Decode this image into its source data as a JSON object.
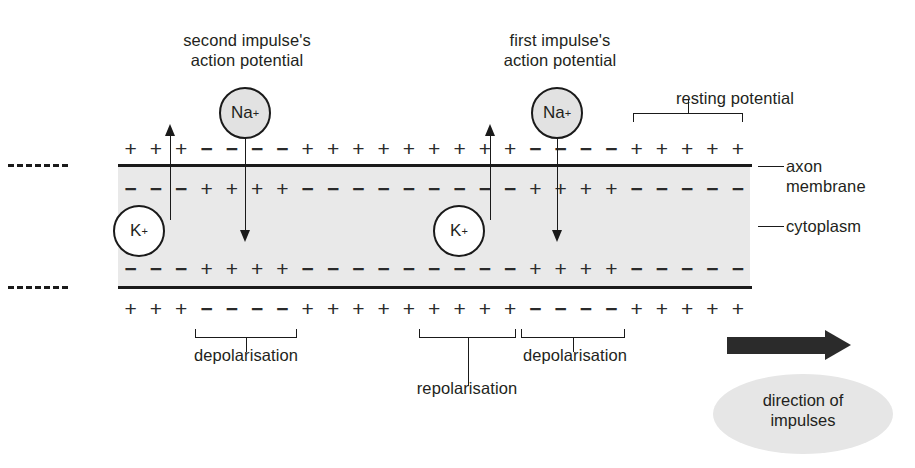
{
  "diagram": {
    "type": "biology-diagram"
  },
  "annotations": {
    "second_impulse": "second impulse's\naction potential",
    "first_impulse": "first impulse's\naction potential",
    "resting_potential": "resting potential",
    "axon_membrane": "axon\nmembrane",
    "cytoplasm": "cytoplasm",
    "depolarisation_left": "depolarisation",
    "repolarisation": "repolarisation",
    "depolarisation_right": "depolarisation",
    "direction_of_impulses": "direction of\nimpulses"
  },
  "ions": {
    "sodium_left": {
      "symbol": "Na",
      "charge": "+"
    },
    "sodium_right": {
      "symbol": "Na",
      "charge": "+"
    },
    "potassium_left": {
      "symbol": "K",
      "charge": "+"
    },
    "potassium_right": {
      "symbol": "K",
      "charge": "+"
    }
  },
  "charge_rows": {
    "outer_top": [
      "+",
      "+",
      "+",
      "−",
      "−",
      "−",
      "−",
      "+",
      "+",
      "+",
      "+",
      "+",
      "+",
      "+",
      "+",
      "+",
      "−",
      "−",
      "−",
      "−",
      "+",
      "+",
      "+",
      "+",
      "+"
    ],
    "inner_top": [
      "−",
      "−",
      "−",
      "+",
      "+",
      "+",
      "+",
      "−",
      "−",
      "−",
      "−",
      "−",
      "−",
      "−",
      "−",
      "−",
      "+",
      "+",
      "+",
      "+",
      "−",
      "−",
      "−",
      "−",
      "−"
    ],
    "inner_bottom": [
      "−",
      "−",
      "−",
      "+",
      "+",
      "+",
      "+",
      "−",
      "−",
      "−",
      "−",
      "−",
      "−",
      "−",
      "−",
      "−",
      "+",
      "+",
      "+",
      "+",
      "−",
      "−",
      "−",
      "−",
      "−"
    ],
    "outer_bottom": [
      "+",
      "+",
      "+",
      "−",
      "−",
      "−",
      "−",
      "+",
      "+",
      "+",
      "+",
      "+",
      "+",
      "+",
      "+",
      "+",
      "−",
      "−",
      "−",
      "−",
      "+",
      "+",
      "+",
      "+",
      "+"
    ]
  },
  "colors": {
    "cytoplasm_fill": "#e9e9e9",
    "membrane_line": "#1a1a1a",
    "sodium_fill": "#e2e2e2",
    "potassium_fill": "#ffffff",
    "direction_arrow": "#2b2b2b",
    "direction_ellipse": "#e6e6e6",
    "text": "#231f20"
  }
}
